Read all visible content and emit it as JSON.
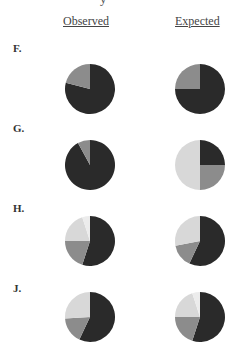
{
  "header": {
    "clipped_title_glyph": "y",
    "columns": [
      "Observed",
      "Expected"
    ]
  },
  "colors": {
    "dark": "#2a2a2a",
    "medium": "#8c8c8c",
    "light": "#d8d8d8",
    "lightest": "#ececec"
  },
  "rows": [
    {
      "label": "F.",
      "observed": [
        79,
        21
      ],
      "expected": [
        75,
        25
      ]
    },
    {
      "label": "G.",
      "observed": [
        92,
        8
      ],
      "expected": [
        25,
        25,
        50
      ]
    },
    {
      "label": "H.",
      "observed": [
        55,
        20,
        20,
        5
      ],
      "expected": [
        57,
        15,
        28
      ]
    },
    {
      "label": "J.",
      "observed": [
        57,
        17,
        26
      ],
      "expected": [
        55,
        20,
        20,
        5
      ]
    }
  ],
  "chart_data": {
    "type": "pie",
    "title": "",
    "layout": "grid of 4 rows x 2 columns of pie charts",
    "columns": [
      "Observed",
      "Expected"
    ],
    "slice_order": "clockwise from 12 o'clock: dark, medium gray, light gray, lightest gray",
    "slice_colors": [
      "#2a2a2a",
      "#8c8c8c",
      "#d8d8d8",
      "#ececec"
    ],
    "legend": "none",
    "grid": false,
    "series": [
      {
        "name": "F. Observed",
        "values": [
          79,
          21
        ]
      },
      {
        "name": "F. Expected",
        "values": [
          75,
          25
        ]
      },
      {
        "name": "G. Observed",
        "values": [
          92,
          8
        ]
      },
      {
        "name": "G. Expected",
        "values": [
          25,
          25,
          50
        ]
      },
      {
        "name": "H. Observed",
        "values": [
          55,
          20,
          20,
          5
        ]
      },
      {
        "name": "H. Expected",
        "values": [
          57,
          15,
          28
        ]
      },
      {
        "name": "J. Observed",
        "values": [
          57,
          17,
          26
        ]
      },
      {
        "name": "J. Expected",
        "values": [
          55,
          20,
          20,
          5
        ]
      }
    ]
  }
}
